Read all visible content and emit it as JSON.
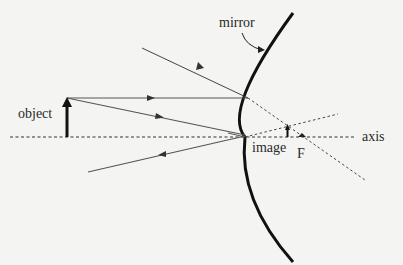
{
  "diagram": {
    "labels": {
      "mirror": "mirror",
      "object": "object",
      "image": "image",
      "focal_point": "F",
      "axis": "axis"
    },
    "colors": {
      "background": "#f4f4f2",
      "ink": "#2a2a2a",
      "ray": "#555555",
      "mirror": "#111111"
    },
    "elements": {
      "principal_axis": {
        "style": "dashed",
        "from": [
          10,
          137
        ],
        "to": [
          355,
          137
        ]
      },
      "mirror_curve": {
        "style": "solid-thick",
        "top": [
          293,
          13
        ],
        "vertex": [
          245,
          137
        ],
        "bottom": [
          293,
          262
        ]
      },
      "object_arrow": {
        "base": [
          67,
          137
        ],
        "tip": [
          67,
          98
        ]
      },
      "image_arrow": {
        "base": [
          287,
          137
        ],
        "tip": [
          287,
          125
        ]
      },
      "focal_point": [
        302,
        137
      ],
      "rays": [
        {
          "name": "incident-parallel-ray",
          "from": [
            67,
            98
          ],
          "to": [
            248,
            98
          ],
          "arrow_at": [
            150,
            98
          ]
        },
        {
          "name": "reflected-ray-1",
          "from": [
            248,
            98
          ],
          "to": [
            142,
            48
          ],
          "arrow_at": [
            199,
            64
          ]
        },
        {
          "name": "virtual-extension-1",
          "style": "dashed",
          "from": [
            248,
            98
          ],
          "to": [
            365,
            180
          ]
        },
        {
          "name": "incident-ray-to-vertex",
          "from": [
            67,
            98
          ],
          "to": [
            245,
            135
          ],
          "arrow_at": [
            160,
            117
          ]
        },
        {
          "name": "reflected-ray-2",
          "from": [
            245,
            137
          ],
          "to": [
            88,
            172
          ],
          "arrow_at": [
            162,
            155
          ]
        },
        {
          "name": "virtual-extension-2",
          "style": "dashed",
          "from": [
            245,
            137
          ],
          "to": [
            338,
            114
          ]
        }
      ]
    }
  }
}
